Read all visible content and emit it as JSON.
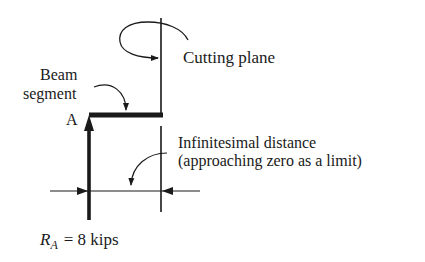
{
  "diagram": {
    "labels": {
      "cutting_plane": "Cutting plane",
      "beam_line1": "Beam",
      "beam_line2": "segment",
      "point_a": "A",
      "distance_line1": "Infinitesimal distance",
      "distance_line2": "(approaching zero as a limit)",
      "reaction_symbol": "R",
      "reaction_subscript": "A",
      "reaction_value": "= 8 kips"
    },
    "colors": {
      "ink": "#1a1a1a",
      "background": "#ffffff"
    }
  }
}
